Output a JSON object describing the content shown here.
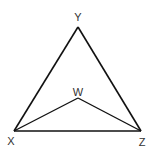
{
  "diagram": {
    "type": "geometry-triangle",
    "points": {
      "Y": {
        "label": "Y",
        "x": 78,
        "y": 27,
        "label_x": 78,
        "label_y": 21
      },
      "X": {
        "label": "X",
        "x": 14,
        "y": 131,
        "label_x": 11,
        "label_y": 145
      },
      "Z": {
        "label": "Z",
        "x": 141,
        "y": 131,
        "label_x": 142,
        "label_y": 146
      },
      "W": {
        "label": "W",
        "x": 78,
        "y": 98,
        "label_x": 78,
        "label_y": 97
      }
    },
    "segments": [
      [
        "X",
        "Y"
      ],
      [
        "Y",
        "Z"
      ],
      [
        "X",
        "Z"
      ],
      [
        "X",
        "W"
      ],
      [
        "W",
        "Z"
      ]
    ],
    "stroke_color": "#111111"
  }
}
